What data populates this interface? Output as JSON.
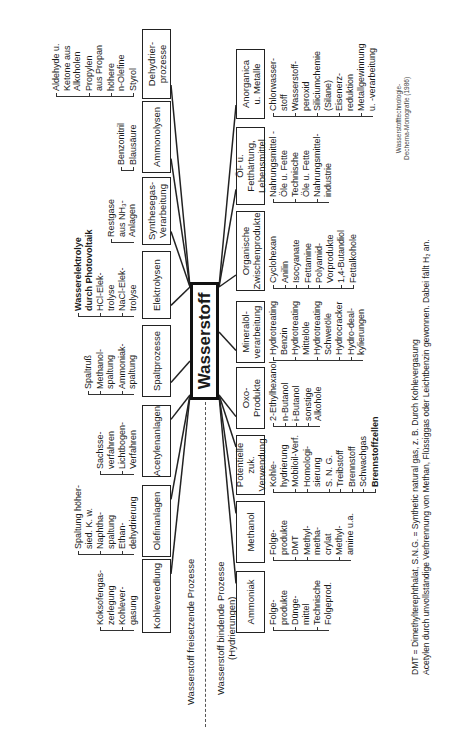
{
  "central": {
    "label": "Wasserstoff"
  },
  "sections": {
    "release": {
      "label": "Wasserstoff freisetzende Prozesse"
    },
    "binding": {
      "label": "Wasserstoff bindende Prozesse",
      "sublabel": "(Hydrierungen)"
    }
  },
  "release_groups": [
    {
      "box": "Kohleveredlung",
      "items": [
        "Koksofengas-\nzerlegung",
        "Kohlever-\ngasung"
      ]
    },
    {
      "box": "Olefinanlagen",
      "items": [
        "Spaltung höher-\nsied. K. w.",
        "Naphtha-\nspaltung",
        "Ethan-\ndehydrierung"
      ]
    },
    {
      "box": "Acetylenanlagen",
      "items": [
        "Sachsse-\nverfahren",
        "Lichtbogen-\nVerfahren"
      ]
    },
    {
      "box": "Spaltprozesse",
      "items": [
        "Spaltruß",
        "Methanol-\nspaltung",
        "Ammoniak-\nspaltung"
      ]
    },
    {
      "box": "Elektrolysen",
      "items": [
        "Wasserelektrolye\ndurch Photovoltaik",
        "HCl-Elek-\ntrolyse",
        "NaCl-Elek-\ntrolyse"
      ],
      "bold_items": [
        0
      ]
    },
    {
      "box": "Synthesegas-\nVerarbeitung",
      "items": [
        "Restgase\naus NH₃-\nAnlagen"
      ]
    },
    {
      "box": "Ammonolysen",
      "items": [
        "Benzonitril",
        "Blausäure"
      ]
    },
    {
      "box": "Dehydrier-\nprozesse",
      "items": [
        "Aldehyde u.\nKetone aus\nAlkoholen",
        "Propylen\naus Propan",
        "höhere\nn-Olefine",
        "Styrol"
      ]
    }
  ],
  "binding_groups": [
    {
      "box": "Ammoniak",
      "items": [
        "Folge-\nprodukte",
        "Dünge-\nmittel",
        "Technische\nFolgeprod."
      ]
    },
    {
      "box": "Methanol",
      "items": [
        "Folge-\nprodukte",
        "DMT",
        "Methyl-\nmetha-\ncrylat",
        "Methyl-\namine u.a."
      ]
    },
    {
      "box": "Potentielle zuk.\nVerwendung",
      "items": [
        "Kohle-\nhydrierung",
        "Mobiloil-Verf.",
        "Homologi-\nsierung",
        "S. N. G.",
        "Treibstoff",
        "Brennstoff",
        "Schwachgas",
        "Brennstoffzellen"
      ],
      "bold_items": [
        7
      ]
    },
    {
      "box": "Oxo-Produkte",
      "items": [
        "2-Ethylhexanol",
        "n-Butanol",
        "i-Butanol",
        "sonstige\nAlkohole"
      ]
    },
    {
      "box": "Mineralöl-\nverarbeitung",
      "items": [
        "Hydrotreating\nBenzin",
        "Hydrotreating\nMittelöle",
        "Hydrotreating\nSchweröle",
        "Hydrocracker",
        "Hydro-deal-\nkylierungen"
      ]
    },
    {
      "box": "Organische\nZwischenprodukte",
      "items": [
        "Cyclohexan",
        "Anilin",
        "Isocyanate",
        "Fettamine",
        "Polyamid-\nVorprodukte",
        "1,4-Butandiol",
        "Fettalkohole"
      ]
    },
    {
      "box": "Öl- u. Fetthärtung,\nLebensmittel",
      "items": [
        "Nahrungsmittel -\nÖle u. Fette",
        "Technische\nÖle u. Fette",
        "Nahrungsmittel-\nindustrie"
      ]
    },
    {
      "box": "Anorganica\nu. Metalle",
      "items": [
        "Chlorwasser-\nstoff",
        "Wasserstoff-\nperoxid",
        "Siliciumchemie\n(Silane)",
        "Eisenerz-\nreduktion",
        "Metallgewinnung\nu. -verarbeitung"
      ]
    }
  ],
  "footnotes": {
    "line1": "DMT = Dimethylterephthalat, S.N.G. = Synthetic natural gas, z. B. Durch Kohlevergasung",
    "line2": "Acetylen durch unvollständige Verbrennung von Methan, Flüssiggas oder Leichtbenzin gewonnen. Dabei fällt H₂ an."
  },
  "credit": {
    "line1": "Wasserstofftechnologie-",
    "line2": "Dechema-Monografie (1986)"
  }
}
